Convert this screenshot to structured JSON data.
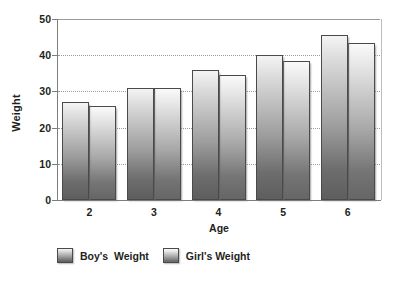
{
  "chart_data": {
    "type": "bar",
    "title": "",
    "xlabel": "Age",
    "ylabel": "Weight",
    "categories": [
      "2",
      "3",
      "4",
      "5",
      "6"
    ],
    "series": [
      {
        "name": "Boy's  Weight",
        "values": [
          27,
          31,
          36,
          40,
          45.5
        ]
      },
      {
        "name": "Girl's Weight",
        "values": [
          26,
          31,
          34.5,
          38.5,
          43.5
        ]
      }
    ],
    "ylim": [
      0,
      50
    ],
    "yticks": [
      0,
      10,
      20,
      30,
      40,
      50
    ],
    "ytick_labels": [
      "0",
      "10",
      "20",
      "30",
      "40",
      "50"
    ],
    "grid": true,
    "grid_axis": "y",
    "legend_position": "bottom-left",
    "colors": {
      "boys_top": "#f4f4f4",
      "boys_bottom": "#5e5e5e",
      "girls_top": "#fafafa",
      "girls_bottom": "#666666",
      "bar_border": "#4a4a4a",
      "axis": "#7d7d7d",
      "gridline": "#9a9a9a",
      "text": "#231f20",
      "background": "#ffffff"
    }
  },
  "legend": {
    "items": [
      {
        "label": "Boy's  Weight",
        "swatch": "boys"
      },
      {
        "label": "Girl's Weight",
        "swatch": "girls"
      }
    ]
  }
}
